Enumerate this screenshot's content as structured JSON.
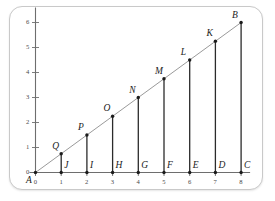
{
  "figure": {
    "title": "",
    "origin_label": "A",
    "endpoint_label": "B"
  },
  "colors": {
    "frame_border": "#c9c9c9",
    "background": "#ffffff",
    "axis": "#6e6e6e",
    "hypotenuse": "#9a9a9a",
    "segment": "#2b2b2b",
    "point": "#1b1b1b",
    "tick_text": "#4a4a4a",
    "label_text": "#1b1b1b"
  },
  "chart_data": {
    "type": "scatter",
    "title": "",
    "xlabel": "",
    "ylabel": "",
    "xlim": [
      0,
      8.35
    ],
    "ylim": [
      0,
      6.6
    ],
    "grid": false,
    "legend": null,
    "x_ticks": [
      "0",
      "1",
      "2",
      "3",
      "4",
      "5",
      "6",
      "7",
      "8"
    ],
    "x_tick_values": [
      0,
      1,
      2,
      3,
      4,
      5,
      6,
      7,
      8
    ],
    "y_ticks": [
      "1",
      "2",
      "3",
      "4",
      "5",
      "6"
    ],
    "y_tick_values": [
      1,
      2,
      3,
      4,
      5,
      6
    ],
    "line": {
      "name": "ray AB",
      "from": [
        0,
        0
      ],
      "to": [
        8,
        6
      ],
      "slope": 0.75
    },
    "series": [
      {
        "name": "points on line AB",
        "labels": [
          "Q",
          "P",
          "O",
          "N",
          "M",
          "L",
          "K",
          "B"
        ],
        "x": [
          1,
          2,
          3,
          4,
          5,
          6,
          7,
          8
        ],
        "y": [
          0.75,
          1.5,
          2.25,
          3,
          3.75,
          4.5,
          5.25,
          6
        ]
      },
      {
        "name": "points on axis AC",
        "labels": [
          "J",
          "I",
          "H",
          "G",
          "F",
          "E",
          "D",
          "C"
        ],
        "x": [
          1,
          2,
          3,
          4,
          5,
          6,
          7,
          8
        ],
        "y": [
          0,
          0,
          0,
          0,
          0,
          0,
          0,
          0
        ]
      }
    ],
    "segments": [
      {
        "label": "QJ",
        "x": 1,
        "y_top": 0.75
      },
      {
        "label": "PI",
        "x": 2,
        "y_top": 1.5
      },
      {
        "label": "OH",
        "x": 3,
        "y_top": 2.25
      },
      {
        "label": "NG",
        "x": 4,
        "y_top": 3
      },
      {
        "label": "MF",
        "x": 5,
        "y_top": 3.75
      },
      {
        "label": "LE",
        "x": 6,
        "y_top": 4.5
      },
      {
        "label": "KD",
        "x": 7,
        "y_top": 5.25
      },
      {
        "label": "BC",
        "x": 8,
        "y_top": 6
      }
    ],
    "annotations": [
      {
        "text": "A",
        "x": 0,
        "y": 0,
        "placement": "below-left"
      },
      {
        "text": "B",
        "x": 8,
        "y": 6,
        "placement": "above-left"
      },
      {
        "text": "C",
        "x": 8,
        "y": 0,
        "placement": "above-right"
      },
      {
        "text": "D",
        "x": 7,
        "y": 0,
        "placement": "above-right"
      },
      {
        "text": "E",
        "x": 6,
        "y": 0,
        "placement": "above-right"
      },
      {
        "text": "F",
        "x": 5,
        "y": 0,
        "placement": "above-right"
      },
      {
        "text": "G",
        "x": 4,
        "y": 0,
        "placement": "above-right"
      },
      {
        "text": "H",
        "x": 3,
        "y": 0,
        "placement": "above-right"
      },
      {
        "text": "I",
        "x": 2,
        "y": 0,
        "placement": "above-right"
      },
      {
        "text": "J",
        "x": 1,
        "y": 0,
        "placement": "above-right"
      },
      {
        "text": "K",
        "x": 7,
        "y": 5.25,
        "placement": "above-left"
      },
      {
        "text": "L",
        "x": 6,
        "y": 4.5,
        "placement": "above-left"
      },
      {
        "text": "M",
        "x": 5,
        "y": 3.75,
        "placement": "above-left"
      },
      {
        "text": "N",
        "x": 4,
        "y": 3,
        "placement": "above-left"
      },
      {
        "text": "O",
        "x": 3,
        "y": 2.25,
        "placement": "above-left"
      },
      {
        "text": "P",
        "x": 2,
        "y": 1.5,
        "placement": "above-left"
      },
      {
        "text": "Q",
        "x": 1,
        "y": 0.75,
        "placement": "above-left"
      }
    ]
  }
}
